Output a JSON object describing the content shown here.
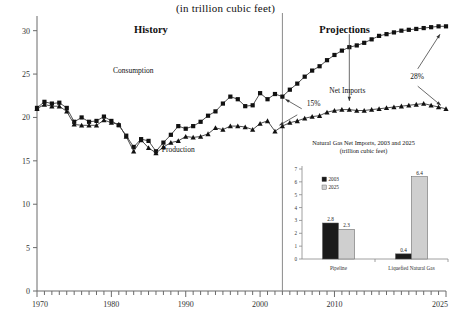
{
  "chart_data": {
    "type": "line",
    "title": "(in trillion cubic feet)",
    "xlabel": "",
    "ylabel": "",
    "xlim": [
      1970,
      2025
    ],
    "ylim": [
      0,
      31
    ],
    "yticks": [
      "0",
      "5",
      "10",
      "15",
      "20",
      "25",
      "30"
    ],
    "ytick_values": [
      0,
      5,
      10,
      15,
      20,
      25,
      30
    ],
    "xticks": [
      "1970",
      "1980",
      "1990",
      "2000",
      "2010",
      "2025"
    ],
    "xtick_values": [
      1970,
      1980,
      1990,
      2000,
      2010,
      2025
    ],
    "grid": false,
    "legend": "none",
    "divider_year": 2003,
    "era_labels": [
      {
        "text": "History",
        "x": 1986
      },
      {
        "text": "Projections",
        "x": 2012
      }
    ],
    "annotations": [
      {
        "text": "Consumption",
        "x": 1984,
        "y": 25.2
      },
      {
        "text": "Production",
        "x": 1990,
        "y": 16.2
      },
      {
        "text": "Net Imports",
        "x": 2012,
        "y": 23.0
      },
      {
        "text": "15%",
        "x": 2006,
        "y": 21.5
      },
      {
        "text": "28%",
        "x": 2021,
        "y": 24.5
      }
    ],
    "series": [
      {
        "name": "Consumption",
        "marker": "square",
        "x": [
          1970,
          1971,
          1972,
          1973,
          1974,
          1975,
          1976,
          1977,
          1978,
          1979,
          1980,
          1981,
          1982,
          1983,
          1984,
          1985,
          1986,
          1987,
          1988,
          1989,
          1990,
          1991,
          1992,
          1993,
          1994,
          1995,
          1996,
          1997,
          1998,
          1999,
          2000,
          2001,
          2002,
          2003,
          2004,
          2005,
          2006,
          2007,
          2008,
          2009,
          2010,
          2011,
          2012,
          2013,
          2014,
          2015,
          2016,
          2017,
          2018,
          2019,
          2020,
          2021,
          2022,
          2023,
          2024,
          2025
        ],
        "values": [
          21.1,
          21.8,
          21.6,
          21.7,
          21.1,
          19.5,
          20.0,
          19.5,
          19.6,
          20.1,
          19.6,
          19.1,
          17.9,
          16.6,
          17.5,
          17.3,
          16.1,
          17.1,
          18.0,
          19.0,
          18.7,
          19.0,
          19.5,
          20.2,
          20.7,
          21.6,
          22.4,
          22.1,
          21.3,
          21.4,
          22.8,
          22.1,
          22.7,
          22.4,
          23.2,
          23.9,
          24.7,
          25.4,
          25.9,
          26.6,
          27.2,
          27.7,
          28.1,
          28.3,
          28.6,
          29.0,
          29.4,
          29.6,
          29.8,
          30.0,
          30.1,
          30.2,
          30.3,
          30.4,
          30.5,
          30.5
        ]
      },
      {
        "name": "Production",
        "marker": "triangle",
        "x": [
          1970,
          1971,
          1972,
          1973,
          1974,
          1975,
          1976,
          1977,
          1978,
          1979,
          1980,
          1981,
          1982,
          1983,
          1984,
          1985,
          1986,
          1987,
          1988,
          1989,
          1990,
          1991,
          1992,
          1993,
          1994,
          1995,
          1996,
          1997,
          1998,
          1999,
          2000,
          2001,
          2002,
          2003,
          2004,
          2005,
          2006,
          2007,
          2008,
          2009,
          2010,
          2011,
          2012,
          2013,
          2014,
          2015,
          2016,
          2017,
          2018,
          2019,
          2020,
          2021,
          2022,
          2023,
          2024,
          2025
        ],
        "values": [
          21.0,
          21.5,
          21.3,
          21.3,
          20.7,
          19.2,
          19.1,
          19.1,
          19.1,
          19.7,
          19.4,
          19.2,
          17.8,
          16.1,
          17.4,
          16.5,
          15.9,
          16.6,
          17.1,
          17.3,
          17.8,
          17.7,
          17.8,
          18.1,
          18.8,
          18.6,
          19.0,
          19.0,
          18.9,
          18.6,
          19.3,
          19.6,
          18.4,
          19.0,
          19.4,
          19.6,
          19.9,
          20.1,
          20.2,
          20.6,
          20.8,
          20.9,
          20.9,
          20.8,
          20.8,
          20.9,
          21.0,
          21.1,
          21.2,
          21.3,
          21.4,
          21.5,
          21.6,
          21.4,
          21.2,
          21.0
        ]
      }
    ]
  },
  "inset_chart": {
    "type": "bar",
    "title_line1": "Natural Gas Net Imports, 2003 and 2025",
    "title_line2": "(trillion cubic feet)",
    "categories": [
      "Pipeline",
      "Liquefied Natural Gas"
    ],
    "yticks": [
      "0",
      "1",
      "2",
      "3",
      "4",
      "5",
      "6",
      "7"
    ],
    "ylim": [
      0,
      7
    ],
    "legend": [
      {
        "label": "2003",
        "color": "#1a1a1a"
      },
      {
        "label": "2025",
        "color": "#cfcfcf"
      }
    ],
    "series": [
      {
        "name": "2003",
        "color": "#1a1a1a",
        "values": [
          2.8,
          0.4
        ],
        "labels": [
          "2.8",
          "0.4"
        ]
      },
      {
        "name": "2025",
        "color": "#cfcfcf",
        "values": [
          2.3,
          6.4
        ],
        "labels": [
          "2.3",
          "6.4"
        ]
      }
    ]
  },
  "colors": {
    "axis": "#6b6b6b",
    "line": "#3a3a3a",
    "marker": "#111111",
    "divider": "#8a8a8a",
    "bar_2003": "#1a1a1a",
    "bar_2025": "#cfcfcf"
  }
}
